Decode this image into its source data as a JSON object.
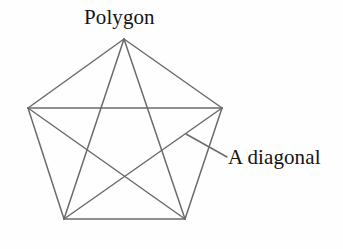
{
  "figure": {
    "background_color": "#fefefe",
    "stroke_color": "#6b6b6b",
    "stroke_width": 1.5,
    "text_color": "#141414",
    "shape": {
      "name": "regular-pentagon",
      "sides": 5,
      "vertices": [
        {
          "id": "top",
          "x": 124,
          "y": 39
        },
        {
          "id": "right",
          "x": 222,
          "y": 108
        },
        {
          "id": "bottom-right",
          "x": 185,
          "y": 219
        },
        {
          "id": "bottom-left",
          "x": 64,
          "y": 219
        },
        {
          "id": "left",
          "x": 28,
          "y": 108
        }
      ],
      "edges": [
        {
          "from": "top",
          "to": "right"
        },
        {
          "from": "right",
          "to": "bottom-right"
        },
        {
          "from": "bottom-right",
          "to": "bottom-left"
        },
        {
          "from": "bottom-left",
          "to": "left"
        },
        {
          "from": "left",
          "to": "top"
        }
      ],
      "diagonals": [
        {
          "from": "top",
          "to": "bottom-right"
        },
        {
          "from": "top",
          "to": "bottom-left"
        },
        {
          "from": "right",
          "to": "bottom-left"
        },
        {
          "from": "right",
          "to": "left"
        },
        {
          "from": "bottom-right",
          "to": "left"
        }
      ],
      "diagonal_count": 5
    },
    "leader_line": {
      "from": {
        "x": 186,
        "y": 134
      },
      "to": {
        "x": 227,
        "y": 157
      },
      "points_to": "diagonal"
    },
    "labels": {
      "polygon": "Polygon",
      "diagonal": "A diagonal"
    }
  }
}
